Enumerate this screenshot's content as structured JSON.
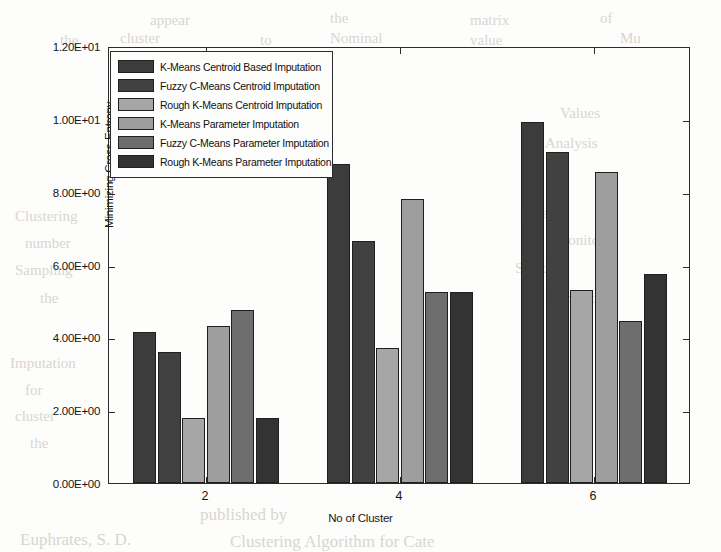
{
  "chart_data": {
    "type": "bar",
    "title": "",
    "xlabel": "No of Cluster",
    "ylabel": "Minimizing Cross-Entropy",
    "categories": [
      "2",
      "4",
      "6"
    ],
    "ylim": [
      0,
      12
    ],
    "ytick_values": [
      0,
      2,
      4,
      6,
      8,
      10,
      12
    ],
    "ytick_labels": [
      "0.00E+00",
      "2.00E+00",
      "4.00E+00",
      "6.00E+00",
      "8.00E+00",
      "1.00E+01",
      "1.20E+01"
    ],
    "grid": false,
    "legend_position": "upper-left-inside",
    "series": [
      {
        "name": "K-Means Centroid Based Imputation",
        "color": "#3c3c3c",
        "values": [
          4.15,
          8.75,
          9.9
        ]
      },
      {
        "name": "Fuzzy C-Means Centroid Imputation",
        "color": "#414141",
        "values": [
          3.6,
          6.65,
          9.1
        ]
      },
      {
        "name": "Rough K-Means Centroid Imputation",
        "color": "#a6a6a6",
        "values": [
          1.78,
          3.7,
          5.3
        ]
      },
      {
        "name": "K-Means Parameter Imputation",
        "color": "#9e9e9e",
        "values": [
          4.3,
          7.8,
          8.55
        ]
      },
      {
        "name": "Fuzzy C-Means Parameter Imputation",
        "color": "#6e6e6e",
        "values": [
          4.75,
          5.25,
          4.45
        ]
      },
      {
        "name": "Rough K-Means Parameter Imputation",
        "color": "#333333",
        "values": [
          1.78,
          5.25,
          5.75
        ]
      }
    ]
  },
  "background_text": [
    {
      "text": "appear",
      "x": 150,
      "y": 12
    },
    {
      "text": "the",
      "x": 330,
      "y": 10
    },
    {
      "text": "matrix",
      "x": 470,
      "y": 12
    },
    {
      "text": "of",
      "x": 600,
      "y": 10
    },
    {
      "text": "the",
      "x": 60,
      "y": 32
    },
    {
      "text": "cluster",
      "x": 120,
      "y": 30
    },
    {
      "text": "to",
      "x": 260,
      "y": 32
    },
    {
      "text": "Nominal",
      "x": 330,
      "y": 30
    },
    {
      "text": "value",
      "x": 470,
      "y": 32
    },
    {
      "text": "Mu",
      "x": 620,
      "y": 30
    },
    {
      "text": "Values",
      "x": 560,
      "y": 105
    },
    {
      "text": "Analysis",
      "x": 545,
      "y": 135
    },
    {
      "text": "Dataset",
      "x": 520,
      "y": 205
    },
    {
      "text": "Monitor",
      "x": 555,
      "y": 232
    },
    {
      "text": "Standard",
      "x": 515,
      "y": 260
    },
    {
      "text": "Symmetric",
      "x": 545,
      "y": 290
    },
    {
      "text": "Clustering",
      "x": 15,
      "y": 208
    },
    {
      "text": "number",
      "x": 25,
      "y": 235
    },
    {
      "text": "Sampling",
      "x": 15,
      "y": 262
    },
    {
      "text": "the",
      "x": 40,
      "y": 290
    },
    {
      "text": "Imputation",
      "x": 10,
      "y": 355
    },
    {
      "text": "for",
      "x": 25,
      "y": 382
    },
    {
      "text": "cluster",
      "x": 15,
      "y": 408
    },
    {
      "text": "the",
      "x": 30,
      "y": 435
    },
    {
      "text": "published by",
      "x": 200,
      "y": 505
    },
    {
      "text": "Euphrates, S. D.",
      "x": 20,
      "y": 530
    },
    {
      "text": "Clustering Algorithm for Cate",
      "x": 230,
      "y": 532
    }
  ]
}
